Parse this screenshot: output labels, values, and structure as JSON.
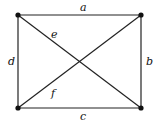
{
  "diagram": {
    "type": "graph",
    "vertices": [
      {
        "id": "v1",
        "x": 18,
        "y": 15
      },
      {
        "id": "v2",
        "x": 141,
        "y": 15
      },
      {
        "id": "v3",
        "x": 141,
        "y": 108
      },
      {
        "id": "v4",
        "x": 18,
        "y": 108
      }
    ],
    "edges": [
      {
        "label": "a",
        "from": "v1",
        "to": "v2",
        "lx": 80,
        "ly": 11
      },
      {
        "label": "b",
        "from": "v2",
        "to": "v3",
        "lx": 146,
        "ly": 65
      },
      {
        "label": "c",
        "from": "v4",
        "to": "v3",
        "lx": 80,
        "ly": 120
      },
      {
        "label": "d",
        "from": "v1",
        "to": "v4",
        "lx": 8,
        "ly": 65
      },
      {
        "label": "e",
        "from": "v1",
        "to": "v3",
        "lx": 51,
        "ly": 38
      },
      {
        "label": "f",
        "from": "v4",
        "to": "v2",
        "lx": 51,
        "ly": 97
      }
    ],
    "colors": {
      "line": "#222222",
      "vertex": "#111111"
    }
  }
}
